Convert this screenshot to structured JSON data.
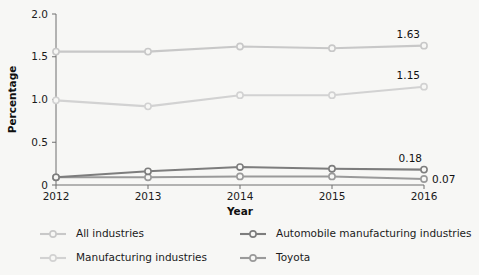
{
  "chart_data": {
    "type": "line",
    "title": "",
    "xlabel": "Year",
    "ylabel": "Percentage",
    "categories": [
      "2012",
      "2013",
      "2014",
      "2015",
      "2016"
    ],
    "x": [
      2012,
      2013,
      2014,
      2015,
      2016
    ],
    "xlim": [
      2012,
      2016
    ],
    "ylim": [
      0,
      2.0
    ],
    "yticks": [
      "0",
      "0.5",
      "1.0",
      "1.5",
      "2.0"
    ],
    "ytick_values": [
      0,
      0.5,
      1.0,
      1.5,
      2.0
    ],
    "grid": false,
    "legend_position": "bottom",
    "series": [
      {
        "name": "All industries",
        "color": "#c8c8c8",
        "values": [
          1.56,
          1.56,
          1.62,
          1.6,
          1.63
        ],
        "end_label": "1.63"
      },
      {
        "name": "Manufacturing industries",
        "color": "#d2d2d2",
        "values": [
          0.99,
          0.92,
          1.05,
          1.05,
          1.15
        ],
        "end_label": "1.15"
      },
      {
        "name": "Automobile manufacturing industries",
        "color": "#7d7d7d",
        "values": [
          0.09,
          0.16,
          0.21,
          0.19,
          0.18
        ],
        "end_label": "0.18"
      },
      {
        "name": "Toyota",
        "color": "#9a9a9a",
        "values": [
          0.09,
          0.09,
          0.1,
          0.1,
          0.07
        ],
        "end_label": "0.07"
      }
    ]
  },
  "legend": {
    "items": [
      {
        "label": "All industries"
      },
      {
        "label": "Automobile manufacturing industries"
      },
      {
        "label": "Manufacturing industries"
      },
      {
        "label": "Toyota"
      }
    ]
  }
}
